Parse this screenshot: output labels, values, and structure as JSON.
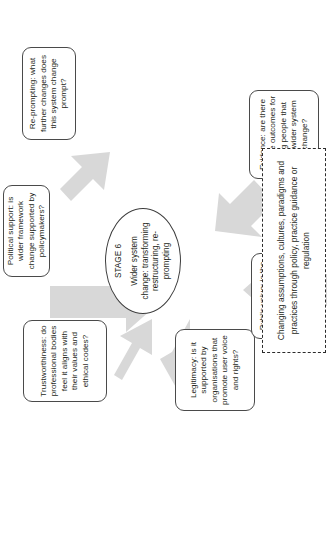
{
  "diagram": {
    "hub": {
      "stage_label": "STAGE 6",
      "description": "Wider system change: transforming restructuring, re-prompting"
    },
    "note": {
      "text": "Changing assumptions, cultures, paradigms and practices through policy, practice guidance or regulation"
    },
    "boxes": [
      {
        "id": "trustworthiness",
        "text": "Trustworthiness: do professional bodies feel it aligns with their values and ethical codes?"
      },
      {
        "id": "political-support",
        "text": "Political support: is wider framework change supported by policymakers?"
      },
      {
        "id": "re-prompting",
        "text": "Re-prompting: what further changes does this system change prompt?"
      },
      {
        "id": "legitimacy",
        "text": "Legitimacy: is it supported by organisations that promote user voice and rights?"
      },
      {
        "id": "public-value",
        "text": "Public value: is the financial investment required to change the system justifiable?"
      },
      {
        "id": "evidence",
        "text": "Evidence: are there positive outcomes for young people that merit wider system change?"
      }
    ],
    "colors": {
      "arrow_fill": "#d8d8d8",
      "box_border": "#4a4a4a",
      "text": "#231f20",
      "note_border": "#2b2b2b",
      "background": "#ffffff"
    }
  }
}
